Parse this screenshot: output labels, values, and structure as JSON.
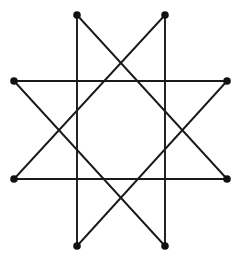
{
  "figure": {
    "name": "star-polygon-octagram",
    "type": "star-polygon",
    "schlafli": "{8/3}",
    "canvas": {
      "width": 243,
      "height": 265,
      "background": "#ffffff"
    },
    "style": {
      "line_color": "#1a1a1a",
      "line_width": 1.9,
      "vertex_color": "#111111",
      "vertex_radius": 3.8
    }
  },
  "chart_data": {
    "type": "scatter",
    "title": "",
    "subtitle": "",
    "xlabel": "",
    "ylabel": "",
    "grid": false,
    "legend": null,
    "axis_visible": false,
    "xlim": [
      0,
      243
    ],
    "ylim": [
      0,
      265
    ],
    "geometry": {
      "shape": "octagram",
      "schlafli_symbol": "{8/3}",
      "vertex_count": 8,
      "step": 3,
      "center": {
        "x": 120.5,
        "y": 130.5
      },
      "circumradius": 118,
      "rotation_deg": 22.5
    },
    "vertices": [
      {
        "id": "V0",
        "label": "top-left",
        "x": 77,
        "y": 15
      },
      {
        "id": "V1",
        "label": "top-right",
        "x": 165,
        "y": 15
      },
      {
        "id": "V2",
        "label": "right-upper",
        "x": 227,
        "y": 81
      },
      {
        "id": "V3",
        "label": "right-lower",
        "x": 227,
        "y": 179
      },
      {
        "id": "V4",
        "label": "bottom-right",
        "x": 165,
        "y": 246
      },
      {
        "id": "V5",
        "label": "bottom-left",
        "x": 77,
        "y": 246
      },
      {
        "id": "V6",
        "label": "left-lower",
        "x": 14,
        "y": 179
      },
      {
        "id": "V7",
        "label": "left-upper",
        "x": 14,
        "y": 81
      }
    ],
    "edges": [
      {
        "id": "E0",
        "from": "V0",
        "to": "V3",
        "orientation": "diagonal-down-right"
      },
      {
        "id": "E1",
        "from": "V3",
        "to": "V6",
        "orientation": "horizontal"
      },
      {
        "id": "E2",
        "from": "V6",
        "to": "V1",
        "orientation": "diagonal-up-right"
      },
      {
        "id": "E3",
        "from": "V1",
        "to": "V4",
        "orientation": "vertical"
      },
      {
        "id": "E4",
        "from": "V4",
        "to": "V7",
        "orientation": "diagonal-up-left"
      },
      {
        "id": "E5",
        "from": "V7",
        "to": "V2",
        "orientation": "horizontal"
      },
      {
        "id": "E6",
        "from": "V2",
        "to": "V5",
        "orientation": "diagonal-down-left"
      },
      {
        "id": "E7",
        "from": "V5",
        "to": "V0",
        "orientation": "vertical"
      }
    ],
    "path_order": [
      "V0",
      "V3",
      "V6",
      "V1",
      "V4",
      "V7",
      "V2",
      "V5",
      "V0"
    ]
  }
}
